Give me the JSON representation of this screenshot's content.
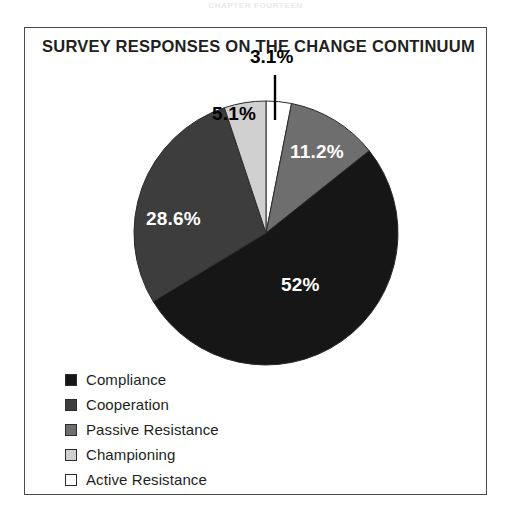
{
  "running_head": "CHAPTER FOURTEEN",
  "figure": {
    "title": "SURVEY RESPONSES ON THE CHANGE CONTINUUM",
    "frame_color": "#4a4a4a",
    "background": "#ffffff"
  },
  "chart_data": {
    "type": "pie",
    "title": "SURVEY RESPONSES ON THE CHANGE CONTINUUM",
    "xlabel": "",
    "ylabel": "",
    "legend_position": "bottom-left",
    "start_angle_deg": 0,
    "direction": "clockwise",
    "categories": [
      "Active Resistance",
      "Cooperation",
      "Compliance",
      "Passive Resistance",
      "Championing"
    ],
    "values": [
      3.1,
      11.2,
      52,
      28.6,
      5.1
    ],
    "labels": [
      "3.1%",
      "11.2%",
      "52%",
      "28.6%",
      "5.1%"
    ],
    "colors": [
      "#ffffff",
      "#6e6e6e",
      "#161616",
      "#3d3d3d",
      "#d0d0d0"
    ],
    "label_text_colors": [
      "#000000",
      "#ffffff",
      "#ffffff",
      "#ffffff",
      "#000000"
    ],
    "slices": [
      {
        "name": "Active Resistance",
        "value": 3.1,
        "label": "3.1%",
        "color": "#ffffff",
        "label_color": "#000000",
        "label_placement": "callout-above",
        "start_deg": 0,
        "end_deg": 11.16
      },
      {
        "name": "Cooperation",
        "value": 11.2,
        "label": "11.2%",
        "color": "#6e6e6e",
        "label_color": "#ffffff",
        "label_placement": "inside",
        "start_deg": 11.16,
        "end_deg": 51.48
      },
      {
        "name": "Compliance",
        "value": 52,
        "label": "52%",
        "color": "#161616",
        "label_color": "#ffffff",
        "label_placement": "inside",
        "start_deg": 51.48,
        "end_deg": 238.68
      },
      {
        "name": "Passive Resistance",
        "value": 28.6,
        "label": "28.6%",
        "color": "#3d3d3d",
        "label_color": "#ffffff",
        "label_placement": "inside",
        "start_deg": 238.68,
        "end_deg": 341.64
      },
      {
        "name": "Championing",
        "value": 5.1,
        "label": "5.1%",
        "color": "#d0d0d0",
        "label_color": "#000000",
        "label_placement": "inside",
        "start_deg": 341.64,
        "end_deg": 360
      }
    ]
  },
  "legend": {
    "items": [
      {
        "label": "Compliance",
        "color": "#161616"
      },
      {
        "label": "Cooperation",
        "color": "#3d3d3d"
      },
      {
        "label": "Passive Resistance",
        "color": "#6e6e6e"
      },
      {
        "label": "Championing",
        "color": "#d0d0d0"
      },
      {
        "label": "Active Resistance",
        "color": "#ffffff"
      }
    ]
  }
}
